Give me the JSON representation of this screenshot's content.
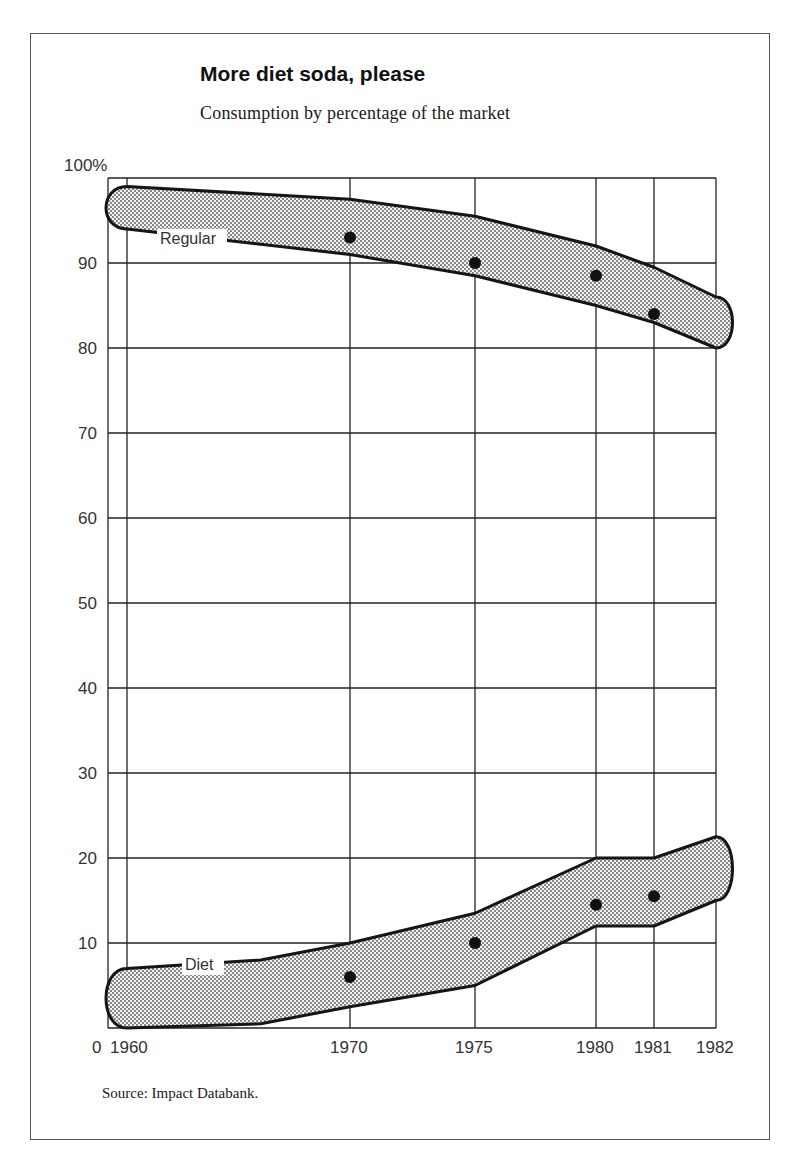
{
  "title": "More diet soda, please",
  "subtitle": "Consumption by percentage of the market",
  "source": "Source: Impact Databank.",
  "chart_data": {
    "type": "line",
    "title": "More diet soda, please",
    "subtitle": "Consumption by percentage of the market",
    "xlabel": "",
    "ylabel": "",
    "x": [
      1960,
      1970,
      1975,
      1980,
      1981,
      1982
    ],
    "x_tick_labels": [
      "0",
      "1960",
      "1970",
      "1975",
      "1980",
      "1981",
      "1982"
    ],
    "y_tick_labels": [
      "100%",
      "90",
      "80",
      "70",
      "60",
      "50",
      "40",
      "30",
      "20",
      "10"
    ],
    "ylim": [
      0,
      100
    ],
    "grid": true,
    "legend": "inline labels",
    "series": [
      {
        "name": "Regular",
        "points": [
          {
            "x": 1970,
            "y": 93
          },
          {
            "x": 1975,
            "y": 90
          },
          {
            "x": 1980,
            "y": 88.5
          },
          {
            "x": 1981,
            "y": 84
          }
        ],
        "band_upper": [
          [
            1960,
            99
          ],
          [
            1970,
            97.5
          ],
          [
            1975,
            95.5
          ],
          [
            1980,
            92
          ],
          [
            1981,
            89.5
          ],
          [
            1982,
            86
          ]
        ],
        "band_lower": [
          [
            1960,
            94
          ],
          [
            1970,
            91
          ],
          [
            1975,
            88.5
          ],
          [
            1980,
            85
          ],
          [
            1981,
            83
          ],
          [
            1982,
            80
          ]
        ]
      },
      {
        "name": "Diet",
        "points": [
          {
            "x": 1970,
            "y": 6
          },
          {
            "x": 1975,
            "y": 10
          },
          {
            "x": 1980,
            "y": 14.5
          },
          {
            "x": 1981,
            "y": 15.5
          }
        ],
        "band_upper": [
          [
            1960,
            7
          ],
          [
            1966,
            8
          ],
          [
            1970,
            10
          ],
          [
            1975,
            13.5
          ],
          [
            1980,
            20
          ],
          [
            1981,
            20
          ],
          [
            1982,
            22.5
          ]
        ],
        "band_lower": [
          [
            1960,
            0
          ],
          [
            1966,
            0.5
          ],
          [
            1970,
            2.5
          ],
          [
            1975,
            5
          ],
          [
            1980,
            12
          ],
          [
            1981,
            12
          ],
          [
            1982,
            15
          ]
        ]
      }
    ]
  },
  "labels": {
    "regular": "Regular",
    "diet": "Diet"
  },
  "colors": {
    "line": "#1a1a1a",
    "band_fill": "#d9d9d9",
    "grid": "#222222"
  }
}
